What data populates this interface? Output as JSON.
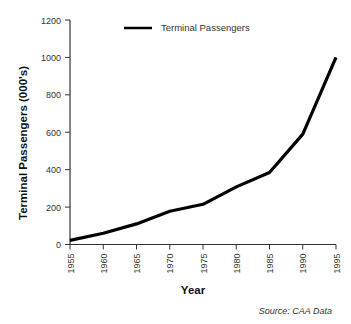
{
  "chart_data": {
    "type": "line",
    "title": "",
    "xlabel": "Year",
    "ylabel": "Terminal Passengers (000's)",
    "x": [
      1955,
      1960,
      1965,
      1970,
      1975,
      1980,
      1985,
      1990,
      1995
    ],
    "series": [
      {
        "name": "Terminal Passengers",
        "values": [
          22,
          60,
          110,
          178,
          215,
          308,
          385,
          590,
          1000
        ],
        "color": "#000000"
      }
    ],
    "xlim": [
      1955,
      1995
    ],
    "ylim": [
      0,
      1200
    ],
    "yticks": [
      0,
      200,
      400,
      600,
      800,
      1000,
      1200
    ],
    "xticks": [
      1955,
      1960,
      1965,
      1970,
      1975,
      1980,
      1985,
      1990,
      1995
    ],
    "grid": false,
    "legend": {
      "position": "top-center",
      "entries": [
        "Terminal Passengers"
      ]
    },
    "annotations": [
      "Source: CAA Data"
    ]
  }
}
